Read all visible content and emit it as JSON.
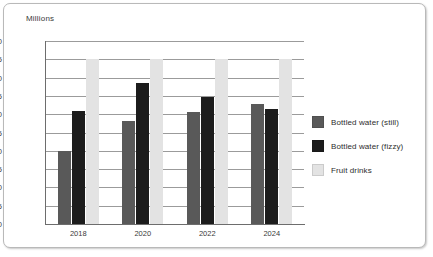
{
  "chart_data": {
    "type": "bar",
    "title": "",
    "subtitle": "",
    "xlabel": "",
    "ylabel": "Millions",
    "axis_unit_caption": "Millions",
    "categories": [
      "2018",
      "2020",
      "2022",
      "2024"
    ],
    "series": [
      {
        "name": "Bottled water (still)",
        "color": "#595959",
        "values": [
          20,
          28.2,
          30.5,
          32.8
        ]
      },
      {
        "name": "Bottled water (fizzy)",
        "color": "#1c1c1c",
        "values": [
          30.9,
          38.6,
          34.7,
          31.3
        ]
      },
      {
        "name": "Fruit drinks",
        "color": "#e3e3e3",
        "values": [
          45,
          45,
          45,
          45
        ]
      }
    ],
    "ylim": [
      0,
      50
    ],
    "yticks": [
      0,
      5,
      10,
      15,
      20,
      25,
      30,
      35,
      40,
      45,
      50
    ],
    "ytick_labels": [
      "0",
      "5",
      "10",
      "15",
      "20",
      "25",
      "30",
      "35",
      "40",
      "45",
      "50"
    ],
    "grid": true,
    "grid_axis": "y",
    "legend_position": "right",
    "legend": [
      "Bottled water (still)",
      "Bottled water (fizzy)",
      "Fruit drinks"
    ]
  },
  "colors": {
    "still": "#595959",
    "fizzy": "#1c1c1c",
    "fruit": "#e3e3e3",
    "gridline": "#9b9b9b",
    "axis": "#6d6d6d",
    "text": "#3a3a3a",
    "frame_border": "#b9b9b9",
    "background": "#ffffff"
  }
}
